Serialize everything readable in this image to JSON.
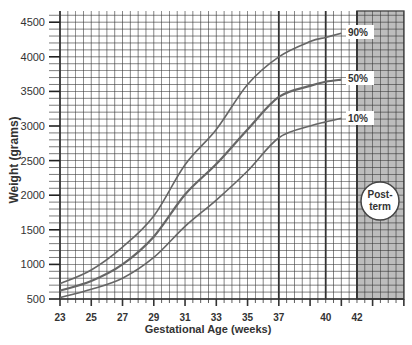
{
  "chart_data": {
    "type": "line",
    "title": "",
    "xlabel": "Gestational Age (weeks)",
    "ylabel": "Weight (grams)",
    "xlim": [
      23,
      45
    ],
    "ylim": [
      500,
      4600
    ],
    "x_tick_labels": [
      "23",
      "25",
      "27",
      "29",
      "31",
      "33",
      "35",
      "37",
      "40",
      "42"
    ],
    "x_tick_values": [
      23,
      25,
      27,
      29,
      31,
      33,
      35,
      37,
      40,
      42
    ],
    "y_tick_labels": [
      "500",
      "1000",
      "1500",
      "2000",
      "2500",
      "3000",
      "3500",
      "4000",
      "4500"
    ],
    "y_tick_values": [
      500,
      1000,
      1500,
      2000,
      2500,
      3000,
      3500,
      4000,
      4500
    ],
    "grid": true,
    "x": [
      23,
      25,
      27,
      29,
      31,
      33,
      35,
      37,
      39,
      40,
      41
    ],
    "series": [
      {
        "name": "90%",
        "values": [
          720,
          920,
          1250,
          1700,
          2440,
          2950,
          3600,
          4000,
          4220,
          4280,
          4340
        ]
      },
      {
        "name": "50%",
        "values": [
          620,
          760,
          1000,
          1400,
          2010,
          2450,
          2950,
          3420,
          3580,
          3640,
          3670
        ]
      },
      {
        "name": "10%",
        "values": [
          520,
          640,
          800,
          1100,
          1550,
          1930,
          2350,
          2830,
          3000,
          3060,
          3110
        ]
      }
    ],
    "annotations": [
      {
        "text": "Post-term",
        "region": [
          42,
          45
        ],
        "shaded": true
      }
    ]
  },
  "labels": {
    "p90": "90%",
    "p50": "50%",
    "p10": "10%",
    "post_line1": "Post-",
    "post_line2": "term",
    "xlabel": "Gestational Age (weeks)",
    "ylabel": "Weight (grams)"
  },
  "colors": {
    "grid": "#333333",
    "curve": "#666666",
    "shade": "#bdbdbd",
    "text": "#333333"
  }
}
